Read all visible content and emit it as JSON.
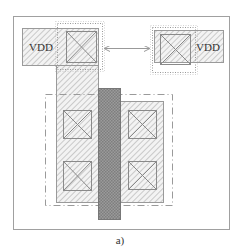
{
  "figure": {
    "caption": "a)",
    "labels": {
      "left_supply": "VDD",
      "right_supply": "VDD"
    },
    "colors": {
      "frame": "#9a9a9a",
      "hatch": "#b0b0b0",
      "hatch_bg": "#f2f2f2",
      "gate": "#8c8c8c",
      "contact": "#8a8a8a",
      "dashed": "#9a9a9a",
      "text": "#333333"
    },
    "elements": [
      {
        "name": "outer-frame",
        "type": "rect",
        "x": 13,
        "y": 16,
        "w": 216,
        "h": 213
      },
      {
        "name": "left-vdd-rail",
        "type": "hatched-rect",
        "x": 22,
        "y": 28,
        "w": 76,
        "h": 37
      },
      {
        "name": "left-vdd-dotted-box",
        "type": "dotted-rect",
        "x": 57,
        "y": 23,
        "w": 45,
        "h": 46
      },
      {
        "name": "left-vdd-contact",
        "type": "contact",
        "x": 66,
        "y": 31,
        "w": 30,
        "h": 31
      },
      {
        "name": "right-vdd-rail",
        "type": "hatched-rect",
        "x": 154,
        "y": 30,
        "w": 69,
        "h": 32
      },
      {
        "name": "right-vdd-dotted-box",
        "type": "dotted-rect",
        "x": 152,
        "y": 27,
        "w": 43,
        "h": 45
      },
      {
        "name": "right-vdd-contact",
        "type": "contact",
        "x": 160,
        "y": 34,
        "w": 30,
        "h": 30
      },
      {
        "name": "spacing-arrow",
        "type": "double-arrow",
        "x1": 104,
        "y": 48,
        "x2": 150
      },
      {
        "name": "well-boundary",
        "type": "dashdot-rect",
        "x": 45,
        "y": 94,
        "w": 127,
        "h": 111
      },
      {
        "name": "left-diffusion",
        "type": "hatched-rect",
        "x": 56,
        "y": 65,
        "w": 42,
        "h": 137
      },
      {
        "name": "right-diffusion",
        "type": "hatched-rect",
        "x": 120,
        "y": 101,
        "w": 43,
        "h": 101
      },
      {
        "name": "poly-gate",
        "type": "gate",
        "x": 98,
        "y": 88,
        "w": 22,
        "h": 131
      },
      {
        "name": "left-top-contact",
        "type": "contact",
        "x": 63,
        "y": 110,
        "w": 28,
        "h": 28
      },
      {
        "name": "left-bottom-contact",
        "type": "contact",
        "x": 63,
        "y": 161,
        "w": 28,
        "h": 29
      },
      {
        "name": "right-top-contact",
        "type": "contact",
        "x": 128,
        "y": 110,
        "w": 28,
        "h": 28
      },
      {
        "name": "right-bottom-contact",
        "type": "contact",
        "x": 128,
        "y": 161,
        "w": 28,
        "h": 28
      }
    ]
  }
}
